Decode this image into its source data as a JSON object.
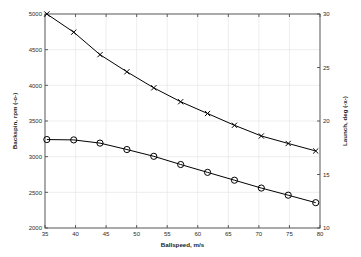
{
  "chart_data": {
    "type": "line",
    "title": "",
    "xlabel": "Ballspeed, m/s",
    "ylabel": "Backspin, rpm (-o-)",
    "ylabel_right": "Launch, deg (-x-)",
    "xlim": [
      35,
      80
    ],
    "ylim": [
      2000,
      5000
    ],
    "ylim_right": [
      10,
      30
    ],
    "xticks": [
      35,
      40,
      45,
      50,
      55,
      60,
      65,
      70,
      75,
      80
    ],
    "yticks": [
      2000,
      2500,
      3000,
      3500,
      4000,
      4500,
      5000
    ],
    "yticks_right": [
      10,
      15,
      20,
      25,
      30
    ],
    "grid": true,
    "legend_position": "none",
    "background": "#ffffff",
    "line_color": "#000000",
    "grid_color": "#e6e6e6",
    "axis_color": "#4d4d4d",
    "series": [
      {
        "name": "Launch, deg (-x-)",
        "axis": "right",
        "marker": "x",
        "x": [
          35.3,
          39.7,
          44.0,
          48.4,
          52.8,
          57.2,
          61.6,
          66.0,
          70.4,
          74.8,
          79.3
        ],
        "values": [
          30.0,
          28.3,
          26.2,
          24.6,
          23.1,
          21.8,
          20.7,
          19.6,
          18.6,
          17.9,
          17.2
        ]
      },
      {
        "name": "Backspin, rpm (-o-)",
        "axis": "left",
        "marker": "o",
        "x": [
          35.3,
          39.7,
          44.0,
          48.4,
          52.8,
          57.2,
          61.6,
          66.0,
          70.4,
          74.8,
          79.3
        ],
        "values": [
          3240,
          3235,
          3190,
          3100,
          3005,
          2890,
          2780,
          2670,
          2560,
          2460,
          2355
        ]
      }
    ]
  }
}
